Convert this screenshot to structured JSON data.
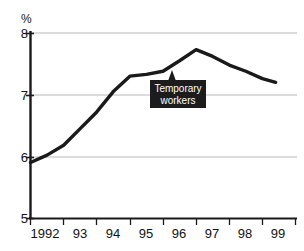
{
  "chart_data": {
    "type": "line",
    "title": "",
    "subtitle": "",
    "xlabel": "",
    "ylabel": "%",
    "ylim": [
      5,
      8
    ],
    "yticks": [
      5,
      6,
      7,
      8
    ],
    "ytick_labels": [
      "5",
      "6",
      "7",
      "8"
    ],
    "xlim": [
      1992,
      1999.5
    ],
    "xticks": [
      1992,
      1993,
      1994,
      1995,
      1996,
      1997,
      1998,
      1999
    ],
    "xtick_labels": [
      "1992",
      "93",
      "94",
      "95",
      "96",
      "97",
      "98",
      "99"
    ],
    "grid": "horizontal",
    "legend": "none",
    "series": [
      {
        "name": "Temporary workers",
        "x": [
          1992.0,
          1992.5,
          1993.0,
          1993.5,
          1994.0,
          1994.5,
          1995.0,
          1995.5,
          1996.0,
          1996.5,
          1997.0,
          1997.5,
          1998.0,
          1998.5,
          1999.0,
          1999.4
        ],
        "values": [
          5.9,
          6.02,
          6.18,
          6.45,
          6.72,
          7.05,
          7.3,
          7.33,
          7.38,
          7.55,
          7.73,
          7.62,
          7.48,
          7.38,
          7.26,
          7.2
        ]
      }
    ],
    "annotations": [
      {
        "name": "temporary-workers-callout",
        "line1": "Temporary",
        "line2": "workers",
        "points_to_x": 1996.0,
        "points_to_y": 7.38
      }
    ],
    "colors": {
      "line": "#1a1a1a",
      "grid": "#b5b5b5",
      "axis": "#1a1a1a",
      "annotation_background": "#1c1c1c",
      "annotation_text": "#ffffff",
      "background": "#ffffff"
    }
  },
  "axis": {
    "unit_label": "%"
  }
}
